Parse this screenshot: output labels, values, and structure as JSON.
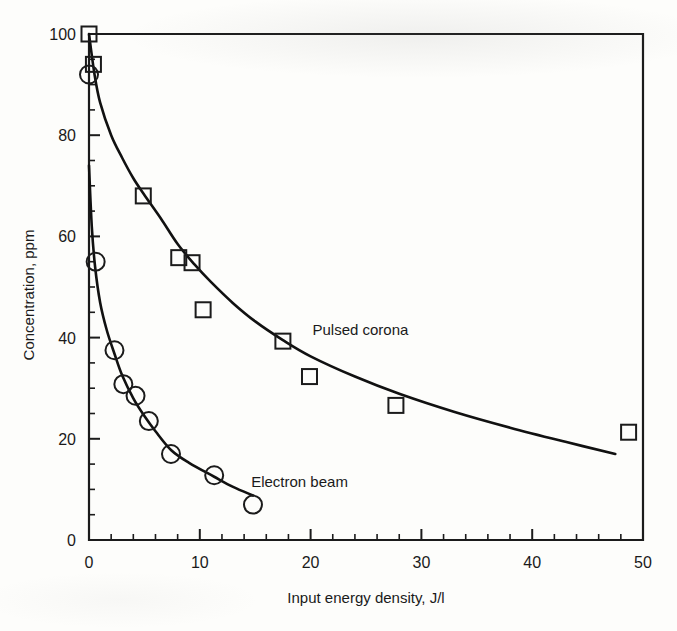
{
  "chart_data": {
    "type": "scatter",
    "title": "",
    "xlabel": "Input energy density, J/l",
    "ylabel": "Concentration, ppm",
    "xlim": [
      0,
      50
    ],
    "ylim": [
      0,
      100
    ],
    "xticks": [
      0,
      10,
      20,
      30,
      40,
      50
    ],
    "xtick_labels": [
      "0",
      "10",
      "20",
      "30",
      "40",
      "50"
    ],
    "yticks": [
      0,
      20,
      40,
      60,
      80,
      100
    ],
    "ytick_labels": [
      "0",
      "20",
      "40",
      "60",
      "80",
      "100"
    ],
    "x_minor_tick_interval": 2,
    "y_minor_tick_interval": 5,
    "grid": false,
    "legend_position": "inline-annotation",
    "series": [
      {
        "name": "Pulsed corona",
        "marker": "square",
        "label_x": 24.5,
        "label_y": 40.5,
        "points": [
          {
            "x": 0.0,
            "y": 100.0
          },
          {
            "x": 0.4,
            "y": 94.0
          },
          {
            "x": 4.9,
            "y": 68.0
          },
          {
            "x": 8.1,
            "y": 55.8
          },
          {
            "x": 9.3,
            "y": 54.8
          },
          {
            "x": 10.3,
            "y": 45.5
          },
          {
            "x": 17.5,
            "y": 39.3
          },
          {
            "x": 19.9,
            "y": 32.3
          },
          {
            "x": 27.7,
            "y": 26.6
          },
          {
            "x": 48.7,
            "y": 21.3
          }
        ],
        "fit_curve": [
          {
            "x": 0.0,
            "y": 100.0
          },
          {
            "x": 0.5,
            "y": 92.0
          },
          {
            "x": 1.0,
            "y": 86.5
          },
          {
            "x": 2.0,
            "y": 80.0
          },
          {
            "x": 3.0,
            "y": 75.5
          },
          {
            "x": 4.0,
            "y": 71.5
          },
          {
            "x": 5.0,
            "y": 68.2
          },
          {
            "x": 6.5,
            "y": 63.5
          },
          {
            "x": 8.0,
            "y": 58.5
          },
          {
            "x": 9.5,
            "y": 54.5
          },
          {
            "x": 11.0,
            "y": 51.0
          },
          {
            "x": 13.0,
            "y": 46.8
          },
          {
            "x": 15.0,
            "y": 43.2
          },
          {
            "x": 17.5,
            "y": 39.5
          },
          {
            "x": 20.0,
            "y": 36.3
          },
          {
            "x": 24.0,
            "y": 32.3
          },
          {
            "x": 28.0,
            "y": 28.9
          },
          {
            "x": 33.0,
            "y": 25.3
          },
          {
            "x": 38.0,
            "y": 22.2
          },
          {
            "x": 43.0,
            "y": 19.4
          },
          {
            "x": 47.5,
            "y": 17.0
          }
        ]
      },
      {
        "name": "Electron beam",
        "marker": "circle",
        "label_x": 19.0,
        "label_y": 10.5,
        "points": [
          {
            "x": 0.0,
            "y": 92.0
          },
          {
            "x": 0.6,
            "y": 55.0
          },
          {
            "x": 2.3,
            "y": 37.5
          },
          {
            "x": 3.1,
            "y": 30.8
          },
          {
            "x": 4.2,
            "y": 28.5
          },
          {
            "x": 5.4,
            "y": 23.5
          },
          {
            "x": 7.4,
            "y": 17.0
          },
          {
            "x": 11.3,
            "y": 12.8
          },
          {
            "x": 14.8,
            "y": 7.0
          }
        ],
        "fit_curve": [
          {
            "x": 0.0,
            "y": 74.0
          },
          {
            "x": 0.25,
            "y": 62.0
          },
          {
            "x": 0.55,
            "y": 54.0
          },
          {
            "x": 1.0,
            "y": 47.0
          },
          {
            "x": 1.6,
            "y": 41.5
          },
          {
            "x": 2.3,
            "y": 36.8
          },
          {
            "x": 3.0,
            "y": 32.5
          },
          {
            "x": 4.0,
            "y": 28.0
          },
          {
            "x": 5.0,
            "y": 24.5
          },
          {
            "x": 6.0,
            "y": 21.5
          },
          {
            "x": 7.4,
            "y": 17.8
          },
          {
            "x": 9.0,
            "y": 15.3
          },
          {
            "x": 11.3,
            "y": 12.5
          },
          {
            "x": 13.0,
            "y": 10.5
          },
          {
            "x": 14.8,
            "y": 8.8
          }
        ]
      }
    ]
  },
  "figure": {
    "background_color": "#fdfdfb",
    "ink_color": "#1b1b1b"
  }
}
